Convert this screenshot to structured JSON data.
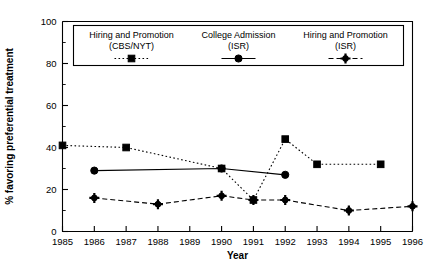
{
  "chart_data": {
    "type": "line",
    "title": "",
    "xlabel": "Year",
    "ylabel": "% favoring preferential treatment",
    "xlim": [
      1985,
      1996
    ],
    "ylim": [
      0,
      100
    ],
    "grid": false,
    "legend_position": "top-inside",
    "xticklabels": [
      "1985",
      "1986",
      "1987",
      "1988",
      "1989",
      "1990",
      "1991",
      "1992",
      "1993",
      "1994",
      "1995",
      "1996"
    ],
    "yticklabels": [
      "0",
      "20",
      "40",
      "60",
      "80",
      "100"
    ],
    "ytick_values": [
      0,
      20,
      40,
      60,
      80,
      100
    ],
    "ytick_minor_values": [
      10,
      30,
      50,
      70,
      90
    ],
    "series": [
      {
        "name": "Hiring and Promotion (CBS/NYT)",
        "legend_line1": "Hiring and Promotion",
        "legend_line2": "(CBS/NYT)",
        "marker": "square",
        "linestyle": "dotted",
        "color": "#000000",
        "points": [
          {
            "x": 1985,
            "y": 41
          },
          {
            "x": 1987,
            "y": 40
          },
          {
            "x": 1990,
            "y": 30
          },
          {
            "x": 1991,
            "y": 15
          },
          {
            "x": 1992,
            "y": 44
          },
          {
            "x": 1993,
            "y": 32
          },
          {
            "x": 1995,
            "y": 32
          }
        ]
      },
      {
        "name": "College Admission (ISR)",
        "legend_line1": "College Admission",
        "legend_line2": "(ISR)",
        "marker": "circle",
        "linestyle": "solid",
        "color": "#000000",
        "points": [
          {
            "x": 1986,
            "y": 29
          },
          {
            "x": 1990,
            "y": 30
          },
          {
            "x": 1992,
            "y": 27
          }
        ]
      },
      {
        "name": "Hiring and Promotion (ISR)",
        "legend_line1": "Hiring and Promotion",
        "legend_line2": "(ISR)",
        "marker": "star",
        "linestyle": "dashed",
        "color": "#000000",
        "points": [
          {
            "x": 1986,
            "y": 16
          },
          {
            "x": 1988,
            "y": 13
          },
          {
            "x": 1990,
            "y": 17
          },
          {
            "x": 1991,
            "y": 15
          },
          {
            "x": 1992,
            "y": 15
          },
          {
            "x": 1994,
            "y": 10
          },
          {
            "x": 1996,
            "y": 12
          }
        ]
      }
    ]
  }
}
